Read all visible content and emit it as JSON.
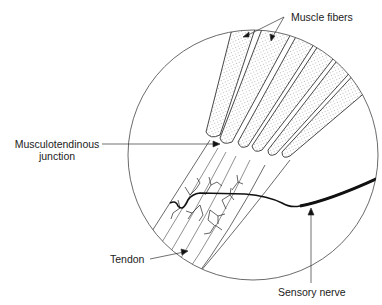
{
  "diagram": {
    "title": "",
    "colors": {
      "line": "#333333",
      "nerve": "#111111",
      "stipple": "#777777",
      "background": "#ffffff"
    },
    "circle": {
      "cx": 253,
      "cy": 155,
      "r": 125
    },
    "labels": {
      "muscle_fibers": "Muscle fibers",
      "musculotendinous_line1": "Musculotendinous",
      "musculotendinous_line2": "junction",
      "tendon": "Tendon",
      "sensory_nerve": "Sensory nerve"
    },
    "fibers": [
      {
        "d": "M232,29 L255,29 L220,135 Q210,140 206,132 Z"
      },
      {
        "d": "M262,29 L292,32 L232,142 Q222,146 220,138 Z"
      },
      {
        "d": "M298,33 L318,38 L248,146 Q240,150 238,142 Z"
      },
      {
        "d": "M322,40 L340,50 L262,150 Q254,154 252,146 Z"
      },
      {
        "d": "M343,53 L356,66 L276,154 Q268,158 268,150 Z"
      },
      {
        "d": "M358,70 L368,90 L290,156 Q282,160 282,152 Z"
      }
    ]
  }
}
